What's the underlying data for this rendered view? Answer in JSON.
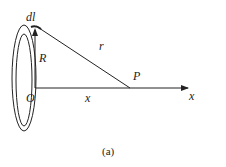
{
  "diagram": {
    "labels": {
      "dl": "dl",
      "R": "R",
      "r": "r",
      "P": "P",
      "O": "O",
      "x_distance": "x",
      "x_axis": "x"
    },
    "caption": "(a)",
    "colors": {
      "stroke": "#222222",
      "background": "#ffffff"
    }
  }
}
